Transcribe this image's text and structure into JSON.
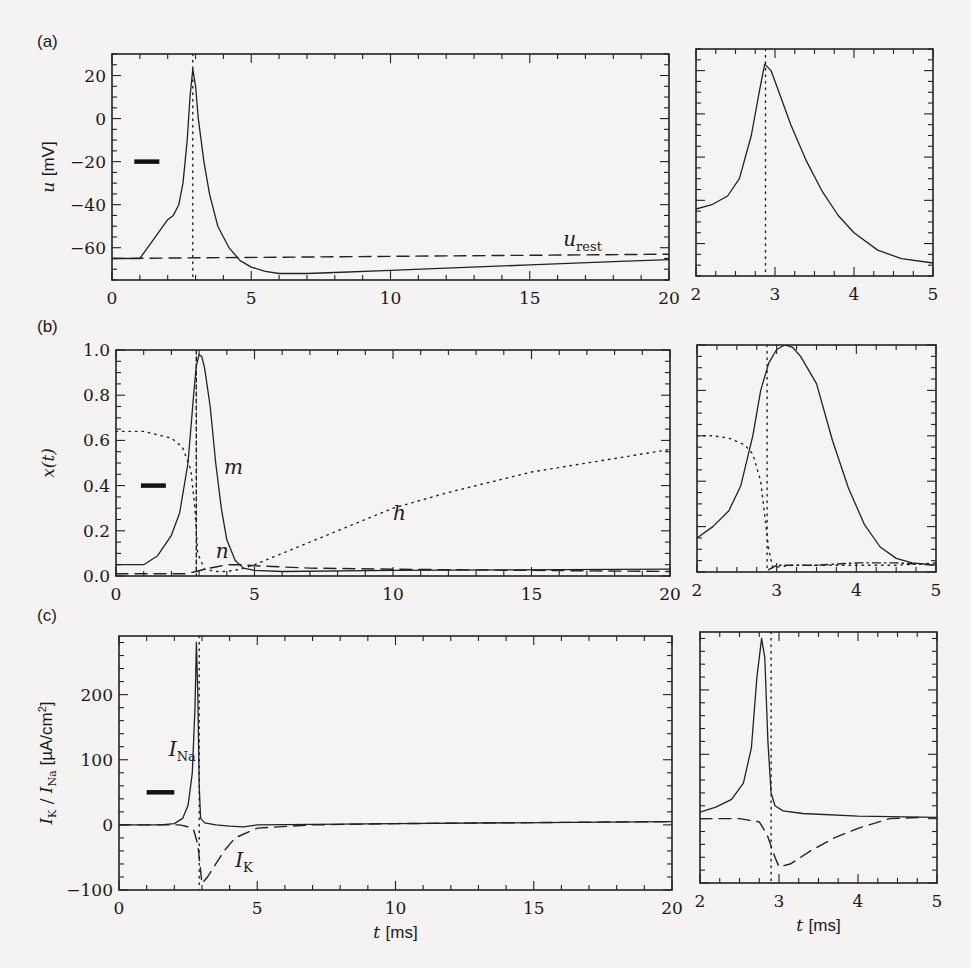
{
  "figure": {
    "panel_labels": [
      "(a)",
      "(b)",
      "(c)"
    ],
    "xlabel": "t [ms]"
  },
  "chart_data": [
    {
      "id": "a-left",
      "type": "line",
      "panel": "(a)",
      "title": "",
      "xlabel": "",
      "ylabel": "u [mV]",
      "xlim": [
        0,
        20
      ],
      "ylim": [
        -75,
        30
      ],
      "xticks": [
        0,
        5,
        10,
        15,
        20
      ],
      "yticks": [
        20,
        0,
        -20,
        -40,
        -60
      ],
      "series": [
        {
          "name": "u(t)",
          "style": "solid",
          "x": [
            0,
            1.0,
            1.5,
            2.0,
            2.2,
            2.4,
            2.55,
            2.7,
            2.8,
            2.9,
            3.0,
            3.1,
            3.3,
            3.5,
            3.8,
            4.2,
            4.6,
            5.0,
            5.5,
            6.0,
            7.0,
            8.0,
            10.0,
            12.0,
            15.0,
            18.0,
            20.0
          ],
          "y": [
            -65,
            -65,
            -56,
            -47,
            -45,
            -40,
            -30,
            -10,
            10,
            23,
            15,
            0,
            -20,
            -35,
            -50,
            -60,
            -66,
            -69,
            -71,
            -72,
            -72,
            -71.5,
            -70.5,
            -69.5,
            -68,
            -66.5,
            -65.5
          ]
        },
        {
          "name": "u_rest",
          "style": "dashed",
          "x": [
            0,
            20
          ],
          "y": [
            -65,
            -63
          ]
        },
        {
          "name": "spike-time",
          "style": "dotted",
          "x": [
            2.9,
            2.9
          ],
          "y": [
            30,
            -75
          ]
        }
      ],
      "annotations": [
        {
          "text": "u_rest",
          "x": 16.2,
          "y": -59
        }
      ],
      "marker_bar": {
        "x": [
          0.8,
          1.7
        ],
        "y": -20
      }
    },
    {
      "id": "a-right",
      "type": "line",
      "panel": "(a)",
      "xlim": [
        2,
        5
      ],
      "ylim": [
        -75,
        30
      ],
      "xticks": [
        2,
        3,
        4,
        5
      ],
      "series": [
        {
          "name": "u(t)",
          "style": "solid",
          "x": [
            2.0,
            2.2,
            2.4,
            2.55,
            2.7,
            2.8,
            2.87,
            2.95,
            3.05,
            3.2,
            3.4,
            3.6,
            3.8,
            4.0,
            4.3,
            4.6,
            5.0
          ],
          "y": [
            -44,
            -42,
            -38,
            -30,
            -10,
            10,
            23,
            20,
            10,
            -5,
            -22,
            -36,
            -47,
            -55,
            -63,
            -67,
            -69
          ]
        },
        {
          "name": "spike-time",
          "style": "dotted",
          "x": [
            2.88,
            2.88
          ],
          "y": [
            30,
            -75
          ]
        }
      ]
    },
    {
      "id": "b-left",
      "type": "line",
      "panel": "(b)",
      "ylabel": "x(t)",
      "xlim": [
        0,
        20
      ],
      "ylim": [
        0,
        1.0
      ],
      "xticks": [
        0,
        5,
        10,
        15,
        20
      ],
      "yticks": [
        0.0,
        0.2,
        0.4,
        0.6,
        0.8,
        1.0
      ],
      "ytick_labels": [
        "0.0",
        "0.2",
        "0.4",
        "0.6",
        "0.8",
        "1.0"
      ],
      "series": [
        {
          "name": "m",
          "style": "solid",
          "x": [
            0,
            1.0,
            1.5,
            2.0,
            2.3,
            2.6,
            2.8,
            2.9,
            3.0,
            3.1,
            3.2,
            3.4,
            3.6,
            3.8,
            4.0,
            4.3,
            4.6,
            5.0,
            6.0,
            10,
            20
          ],
          "y": [
            0.05,
            0.05,
            0.09,
            0.18,
            0.28,
            0.5,
            0.8,
            0.93,
            0.98,
            0.97,
            0.92,
            0.75,
            0.5,
            0.3,
            0.16,
            0.07,
            0.035,
            0.025,
            0.02,
            0.025,
            0.03
          ]
        },
        {
          "name": "h",
          "style": "dotted",
          "x": [
            0,
            1.0,
            2.0,
            2.4,
            2.7,
            2.85,
            2.95,
            3.2,
            3.6,
            4.0,
            4.5,
            5.0,
            6.0,
            8.0,
            10.0,
            12.0,
            15.0,
            18.0,
            20.0
          ],
          "y": [
            0.64,
            0.64,
            0.61,
            0.57,
            0.47,
            0.3,
            0.1,
            0.03,
            0.02,
            0.02,
            0.03,
            0.05,
            0.1,
            0.2,
            0.3,
            0.37,
            0.46,
            0.52,
            0.56
          ]
        },
        {
          "name": "n",
          "style": "dashed",
          "x": [
            0,
            2.5,
            2.9,
            3.2,
            3.6,
            4.0,
            4.5,
            5.0,
            7.0,
            10.0,
            15.0,
            20.0
          ],
          "y": [
            0.01,
            0.01,
            0.02,
            0.03,
            0.04,
            0.05,
            0.05,
            0.045,
            0.035,
            0.03,
            0.025,
            0.02
          ]
        },
        {
          "name": "spike-time",
          "style": "dashed-vertical",
          "x": [
            2.9,
            2.9
          ],
          "y": [
            1.0,
            0
          ]
        }
      ],
      "annotations": [
        {
          "text": "m",
          "x": 3.9,
          "y": 0.45
        },
        {
          "text": "h",
          "x": 10.0,
          "y": 0.25
        },
        {
          "text": "n",
          "x": 3.6,
          "y": 0.08
        }
      ],
      "marker_bar": {
        "x": [
          0.9,
          1.8
        ],
        "y": 0.4
      }
    },
    {
      "id": "b-right",
      "type": "line",
      "panel": "(b)",
      "xlim": [
        2,
        5
      ],
      "ylim": [
        0,
        1.0
      ],
      "xticks": [
        2,
        3,
        4,
        5
      ],
      "series": [
        {
          "name": "m",
          "style": "solid",
          "x": [
            2.0,
            2.2,
            2.4,
            2.55,
            2.7,
            2.8,
            2.9,
            3.0,
            3.1,
            3.2,
            3.3,
            3.5,
            3.7,
            3.9,
            4.1,
            4.3,
            4.5,
            4.7,
            5.0
          ],
          "y": [
            0.15,
            0.2,
            0.27,
            0.38,
            0.6,
            0.8,
            0.92,
            0.98,
            1.0,
            0.99,
            0.95,
            0.83,
            0.58,
            0.37,
            0.21,
            0.11,
            0.06,
            0.04,
            0.03
          ]
        },
        {
          "name": "h",
          "style": "dotted",
          "x": [
            2.0,
            2.2,
            2.4,
            2.6,
            2.7,
            2.8,
            2.85,
            2.9,
            2.95,
            3.2,
            3.6,
            4.0,
            4.5,
            5.0
          ],
          "y": [
            0.6,
            0.6,
            0.59,
            0.56,
            0.52,
            0.4,
            0.25,
            0.1,
            0.02,
            0.03,
            0.03,
            0.03,
            0.03,
            0.04
          ]
        },
        {
          "name": "n",
          "style": "dash-dot",
          "x": [
            2.9,
            3.0,
            3.5,
            4.0,
            4.5,
            5.0
          ],
          "y": [
            0.01,
            0.03,
            0.03,
            0.04,
            0.04,
            0.03
          ]
        },
        {
          "name": "spike-time",
          "style": "dotted",
          "x": [
            2.88,
            2.88
          ],
          "y": [
            1.0,
            0
          ]
        }
      ]
    },
    {
      "id": "c-left",
      "type": "line",
      "panel": "(c)",
      "xlabel": "t [ms]",
      "ylabel": "I_K / I_Na [µA/cm²]",
      "xlim": [
        0,
        20
      ],
      "ylim": [
        -100,
        290
      ],
      "xticks": [
        0,
        5,
        10,
        15,
        20
      ],
      "yticks": [
        200,
        100,
        0,
        -100
      ],
      "series": [
        {
          "name": "I_Na",
          "style": "solid",
          "x": [
            0,
            1.5,
            2.0,
            2.3,
            2.5,
            2.65,
            2.75,
            2.8,
            2.85,
            2.9,
            2.95,
            3.1,
            3.5,
            4.0,
            4.5,
            5.0,
            10.0,
            20.0
          ],
          "y": [
            0,
            0,
            2,
            10,
            30,
            80,
            180,
            280,
            200,
            60,
            10,
            3,
            0,
            -2,
            -3,
            0,
            2,
            5
          ]
        },
        {
          "name": "I_K",
          "style": "dashed",
          "x": [
            0,
            2.2,
            2.5,
            2.7,
            2.85,
            2.95,
            3.0,
            3.2,
            3.5,
            3.8,
            4.2,
            5.0,
            7.0,
            10.0,
            20.0
          ],
          "y": [
            0,
            0,
            -3,
            -8,
            -30,
            -70,
            -90,
            -80,
            -60,
            -40,
            -20,
            -5,
            0,
            2,
            5
          ]
        },
        {
          "name": "spike-time",
          "style": "dotted",
          "x": [
            2.9,
            2.9
          ],
          "y": [
            290,
            -100
          ]
        }
      ],
      "annotations": [
        {
          "text": "I_Na",
          "x": 1.8,
          "y": 105
        },
        {
          "text": "I_K",
          "x": 4.2,
          "y": -65
        }
      ],
      "marker_bar": {
        "x": [
          1.0,
          2.0
        ],
        "y": 50
      }
    },
    {
      "id": "c-right",
      "type": "line",
      "panel": "(c)",
      "xlabel": "t [ms]",
      "xlim": [
        2,
        5
      ],
      "ylim": [
        -100,
        290
      ],
      "xticks": [
        2,
        3,
        4,
        5
      ],
      "series": [
        {
          "name": "I_Na",
          "style": "solid",
          "x": [
            2.0,
            2.2,
            2.4,
            2.55,
            2.65,
            2.72,
            2.78,
            2.82,
            2.86,
            2.9,
            2.95,
            3.05,
            3.3,
            4.0,
            5.0
          ],
          "y": [
            10,
            18,
            30,
            55,
            110,
            220,
            280,
            250,
            120,
            40,
            20,
            12,
            8,
            4,
            2
          ]
        },
        {
          "name": "I_K",
          "style": "dashed",
          "x": [
            2.0,
            2.5,
            2.75,
            2.85,
            2.95,
            3.0,
            3.15,
            3.4,
            3.7,
            4.0,
            4.4,
            4.8
          ],
          "y": [
            0,
            0,
            -5,
            -25,
            -60,
            -75,
            -70,
            -50,
            -30,
            -15,
            0,
            2
          ]
        },
        {
          "name": "spike-time",
          "style": "dotted",
          "x": [
            2.9,
            2.9
          ],
          "y": [
            290,
            -100
          ]
        }
      ]
    }
  ]
}
